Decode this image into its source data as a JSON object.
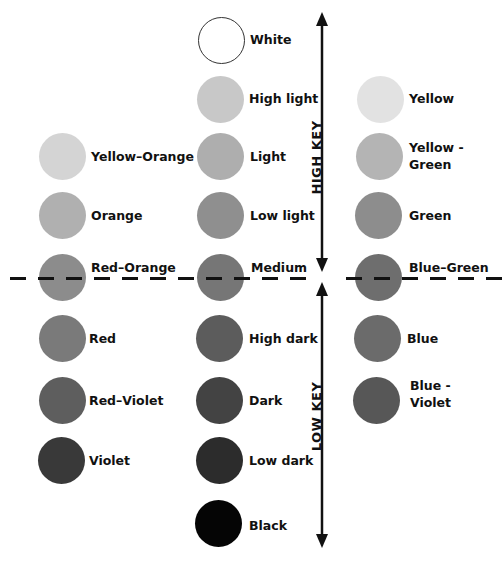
{
  "axis": {
    "high_key_label": "HIGH KEY",
    "low_key_label": "LOW KEY"
  },
  "center_column": [
    {
      "label": "White",
      "color": "#ffffff"
    },
    {
      "label": "High light",
      "color": "#c8c8c8"
    },
    {
      "label": "Light",
      "color": "#aeaeae"
    },
    {
      "label": "Low light",
      "color": "#8f8f8f"
    },
    {
      "label": "Medium",
      "color": "#767676"
    },
    {
      "label": "High dark",
      "color": "#5c5c5c"
    },
    {
      "label": "Dark",
      "color": "#434343"
    },
    {
      "label": "Low dark",
      "color": "#2c2c2c"
    },
    {
      "label": "Black",
      "color": "#050505"
    }
  ],
  "left_column": [
    {
      "label": "Yellow–Orange",
      "color": "#d4d4d4"
    },
    {
      "label": "Orange",
      "color": "#b0b0b0"
    },
    {
      "label": "Red–Orange",
      "color": "#8c8c8c"
    },
    {
      "label": "Red",
      "color": "#7a7a7a"
    },
    {
      "label": "Red–Violet",
      "color": "#5e5e5e"
    },
    {
      "label": "Violet",
      "color": "#393939"
    }
  ],
  "right_column": [
    {
      "label": "Yellow",
      "color": "#e2e2e2"
    },
    {
      "label_line1": "Yellow -",
      "label_line2": "Green",
      "color": "#b4b4b4"
    },
    {
      "label": "Green",
      "color": "#8d8d8d"
    },
    {
      "label": "Blue–Green",
      "color": "#6e6e6e"
    },
    {
      "label": "Blue",
      "color": "#6b6b6b"
    },
    {
      "label_line1": "Blue -",
      "label_line2": "Violet",
      "color": "#575757"
    }
  ]
}
